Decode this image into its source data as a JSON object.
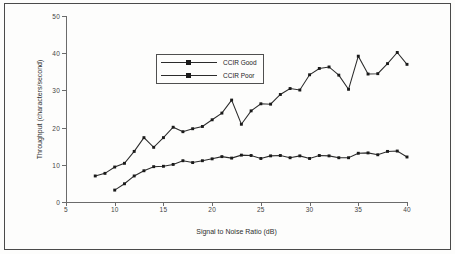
{
  "figure": {
    "background": "#fdfdfc",
    "frame_color": "#4a4a4a",
    "series_color": "#2b2b2b"
  },
  "legend": {
    "position": "upper-left-inside",
    "entries": [
      {
        "label": "CCIR Good",
        "marker": "square"
      },
      {
        "label": "CCIR Poor",
        "marker": "square"
      }
    ]
  },
  "chart_data": {
    "type": "line",
    "title": "",
    "xlabel": "Signal to Noise Ratio (dB)",
    "ylabel": "Throughput (characters/second)",
    "xlim": [
      5,
      40
    ],
    "ylim": [
      0,
      50
    ],
    "xticks": [
      5,
      10,
      15,
      20,
      25,
      30,
      35,
      40
    ],
    "yticks": [
      0,
      10,
      20,
      30,
      40,
      50
    ],
    "xtick_labels": [
      "5",
      "10",
      "15",
      "20",
      "25",
      "30",
      "35",
      "40"
    ],
    "ytick_labels": [
      "0",
      "10",
      "20",
      "30",
      "40",
      "50"
    ],
    "grid": false,
    "marker": "square",
    "series": [
      {
        "name": "CCIR Good",
        "x": [
          8,
          9,
          10,
          11,
          12,
          13,
          14,
          15,
          16,
          17,
          18,
          19,
          20,
          21,
          22,
          23,
          24,
          25,
          26,
          27,
          28,
          29,
          30,
          31,
          32,
          33,
          34,
          35,
          36,
          37,
          38,
          39,
          40
        ],
        "y": [
          7.0,
          7.7,
          9.4,
          10.4,
          13.6,
          17.3,
          14.7,
          17.3,
          20.1,
          18.9,
          19.7,
          20.3,
          22.1,
          23.9,
          27.4,
          20.9,
          24.5,
          26.4,
          26.3,
          28.9,
          30.5,
          30.1,
          34.2,
          35.9,
          36.3,
          34.1,
          30.3,
          39.2,
          34.4,
          34.5,
          37.2,
          40.2,
          37.0
        ]
      },
      {
        "name": "CCIR Poor",
        "x": [
          10,
          11,
          12,
          13,
          14,
          15,
          16,
          17,
          18,
          19,
          20,
          21,
          22,
          23,
          24,
          25,
          26,
          27,
          28,
          29,
          30,
          31,
          32,
          33,
          34,
          35,
          36,
          37,
          38,
          39,
          40
        ],
        "y": [
          3.2,
          4.9,
          7.0,
          8.4,
          9.5,
          9.6,
          10.1,
          11.1,
          10.6,
          11.1,
          11.6,
          12.2,
          11.8,
          12.6,
          12.5,
          11.7,
          12.4,
          12.5,
          11.9,
          12.4,
          11.7,
          12.5,
          12.4,
          11.9,
          11.9,
          13.1,
          13.2,
          12.7,
          13.6,
          13.7,
          12.1
        ]
      }
    ]
  }
}
